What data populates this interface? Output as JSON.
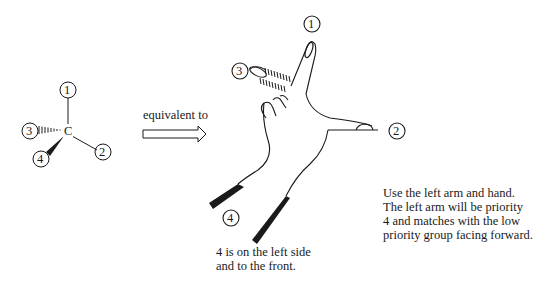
{
  "molecule": {
    "center_atom": "C",
    "groups": [
      {
        "priority": "1",
        "position": "up",
        "bond": "plain"
      },
      {
        "priority": "2",
        "position": "lower-right",
        "bond": "plain"
      },
      {
        "priority": "3",
        "position": "left",
        "bond": "hashed (back)"
      },
      {
        "priority": "4",
        "position": "lower-left",
        "bond": "wedge (front)"
      }
    ]
  },
  "arrow": {
    "label": "equivalent to"
  },
  "hand": {
    "labels": {
      "p1": "1",
      "p2": "2",
      "p3": "3",
      "p4": "4"
    }
  },
  "captions": {
    "left_side": [
      "4 is on the left side",
      "and to the front."
    ],
    "right_side": [
      "Use the left arm and hand.",
      "The left arm will be priority",
      "4 and matches with the low",
      "priority group facing forward."
    ]
  },
  "colors": {
    "ink": "#1a1a1a",
    "background": "#ffffff"
  }
}
